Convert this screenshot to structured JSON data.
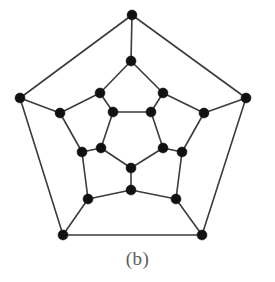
{
  "figure": {
    "caption": "(b)",
    "kind": "graph-diagram",
    "colors": {
      "background": "#ffffff",
      "vertex": "#111111",
      "edge": "#3b3b3b",
      "caption_text": "#5b5b5b"
    },
    "vertex_count": 20,
    "edge_count": 30,
    "vertex_radius": 5.0,
    "edge_width": 1.6
  },
  "graph_data": {
    "type": "graph",
    "title": "(b)",
    "layout": "concentric-pentagonal",
    "rings": [
      {
        "name": "outer-pentagon",
        "count": 5
      },
      {
        "name": "outer-inner-ring",
        "count": 5
      },
      {
        "name": "middle-ring",
        "count": 5
      },
      {
        "name": "inner-pentagon",
        "count": 5
      }
    ],
    "vertices": [
      {
        "id": "o0",
        "ring": "outer-pentagon",
        "x": 132,
        "y": 15
      },
      {
        "id": "o1",
        "ring": "outer-pentagon",
        "x": 246,
        "y": 98
      },
      {
        "id": "o2",
        "ring": "outer-pentagon",
        "x": 202,
        "y": 235
      },
      {
        "id": "o3",
        "ring": "outer-pentagon",
        "x": 63,
        "y": 235
      },
      {
        "id": "o4",
        "ring": "outer-pentagon",
        "x": 20,
        "y": 98
      },
      {
        "id": "a0",
        "ring": "outer-inner-ring",
        "x": 131,
        "y": 61
      },
      {
        "id": "a1",
        "ring": "outer-inner-ring",
        "x": 204,
        "y": 113
      },
      {
        "id": "a2",
        "ring": "outer-inner-ring",
        "x": 176,
        "y": 199
      },
      {
        "id": "a3",
        "ring": "outer-inner-ring",
        "x": 88,
        "y": 199
      },
      {
        "id": "a4",
        "ring": "outer-inner-ring",
        "x": 60,
        "y": 113
      },
      {
        "id": "b0",
        "ring": "middle-ring",
        "x": 100,
        "y": 93
      },
      {
        "id": "b1",
        "ring": "middle-ring",
        "x": 163,
        "y": 93
      },
      {
        "id": "b2",
        "ring": "middle-ring",
        "x": 182,
        "y": 152
      },
      {
        "id": "b3",
        "ring": "middle-ring",
        "x": 131,
        "y": 190
      },
      {
        "id": "b4",
        "ring": "middle-ring",
        "x": 82,
        "y": 152
      },
      {
        "id": "c0",
        "ring": "inner-pentagon",
        "x": 113,
        "y": 112
      },
      {
        "id": "c1",
        "ring": "inner-pentagon",
        "x": 151,
        "y": 112
      },
      {
        "id": "c2",
        "ring": "inner-pentagon",
        "x": 163,
        "y": 148
      },
      {
        "id": "c3",
        "ring": "inner-pentagon",
        "x": 131,
        "y": 168
      },
      {
        "id": "c4",
        "ring": "inner-pentagon",
        "x": 101,
        "y": 148
      }
    ],
    "edges": [
      [
        "o0",
        "o1"
      ],
      [
        "o1",
        "o2"
      ],
      [
        "o2",
        "o3"
      ],
      [
        "o3",
        "o4"
      ],
      [
        "o4",
        "o0"
      ],
      [
        "o0",
        "a0"
      ],
      [
        "o1",
        "a1"
      ],
      [
        "o2",
        "a2"
      ],
      [
        "o3",
        "a3"
      ],
      [
        "o4",
        "a4"
      ],
      [
        "a0",
        "b0"
      ],
      [
        "a0",
        "b1"
      ],
      [
        "a1",
        "b1"
      ],
      [
        "a1",
        "b2"
      ],
      [
        "a2",
        "b2"
      ],
      [
        "a2",
        "b3"
      ],
      [
        "a3",
        "b3"
      ],
      [
        "a3",
        "b4"
      ],
      [
        "a4",
        "b4"
      ],
      [
        "a4",
        "b0"
      ],
      [
        "b0",
        "c0"
      ],
      [
        "b1",
        "c1"
      ],
      [
        "b2",
        "c2"
      ],
      [
        "b3",
        "c3"
      ],
      [
        "b4",
        "c4"
      ],
      [
        "c0",
        "c1"
      ],
      [
        "c1",
        "c2"
      ],
      [
        "c2",
        "c3"
      ],
      [
        "c3",
        "c4"
      ],
      [
        "c4",
        "c0"
      ]
    ]
  }
}
